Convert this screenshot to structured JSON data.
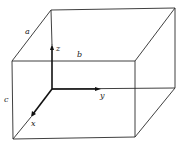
{
  "figure": {
    "edge_labels": {
      "a": "a",
      "b": "b",
      "c": "c"
    },
    "axis_labels": {
      "x": "x",
      "y": "y",
      "z": "z"
    },
    "colors": {
      "line": "#2a2a2a",
      "axis": "#111111",
      "background": "#ffffff"
    }
  }
}
